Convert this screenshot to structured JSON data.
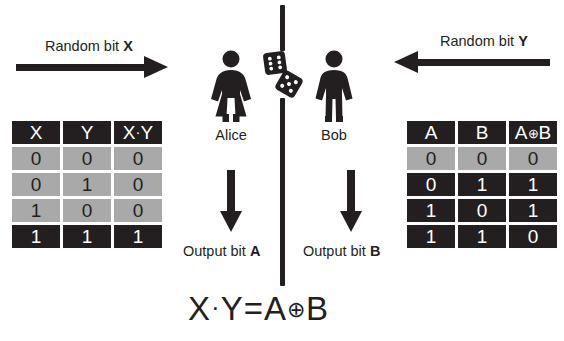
{
  "diagram": {
    "formula": {
      "lhs_left": "X",
      "dot": "·",
      "lhs_right": "Y",
      "equals": "=",
      "rhs_left": "A",
      "xor": "⊕",
      "rhs_right": "B",
      "full": "X · Y = A ⊕ B"
    },
    "colors": {
      "ink": "#231f20",
      "header_fill": "#231f20",
      "row_shaded": "#a9a9a9",
      "row_dark": "#231f20",
      "background": "#ffffff"
    }
  },
  "inputs": {
    "left": {
      "label_text": "Random bit ",
      "label_bit": "X",
      "arrow_direction": "right"
    },
    "right": {
      "label_text": "Random bit ",
      "label_bit": "Y",
      "arrow_direction": "left"
    }
  },
  "players": {
    "alice": {
      "name": "Alice",
      "figure": "female-figure"
    },
    "bob": {
      "name": "Bob",
      "figure": "male-figure"
    }
  },
  "randomness": {
    "icon": "two-dice",
    "dice": [
      {
        "pips": 6,
        "rotation": -8
      },
      {
        "pips": 5,
        "rotation": 28
      }
    ]
  },
  "outputs": {
    "left": {
      "label_text": "Output bit ",
      "label_bit": "A",
      "arrow_direction": "down"
    },
    "right": {
      "label_text": "Output bit ",
      "label_bit": "B",
      "arrow_direction": "down"
    }
  },
  "tables": {
    "left": {
      "name": "and-truth-table",
      "headers": [
        "X",
        "Y",
        "X·Y"
      ],
      "header_parts": {
        "c0": "X",
        "c1": "Y",
        "c2_a": "X",
        "c2_op": "·",
        "c2_b": "Y"
      },
      "rows": [
        {
          "cells": [
            "0",
            "0",
            "0"
          ],
          "style": "light"
        },
        {
          "cells": [
            "0",
            "1",
            "0"
          ],
          "style": "light"
        },
        {
          "cells": [
            "1",
            "0",
            "0"
          ],
          "style": "light"
        },
        {
          "cells": [
            "1",
            "1",
            "1"
          ],
          "style": "dark"
        }
      ]
    },
    "right": {
      "name": "xor-truth-table",
      "headers": [
        "A",
        "B",
        "A⊕B"
      ],
      "header_parts": {
        "c0": "A",
        "c1": "B",
        "c2_a": "A",
        "c2_op": "⊕",
        "c2_b": "B"
      },
      "rows": [
        {
          "cells": [
            "0",
            "0",
            "0"
          ],
          "style": "light"
        },
        {
          "cells": [
            "0",
            "1",
            "1"
          ],
          "style": "dark"
        },
        {
          "cells": [
            "1",
            "0",
            "1"
          ],
          "style": "dark"
        },
        {
          "cells": [
            "1",
            "1",
            "0"
          ],
          "style": "dark"
        }
      ]
    }
  }
}
